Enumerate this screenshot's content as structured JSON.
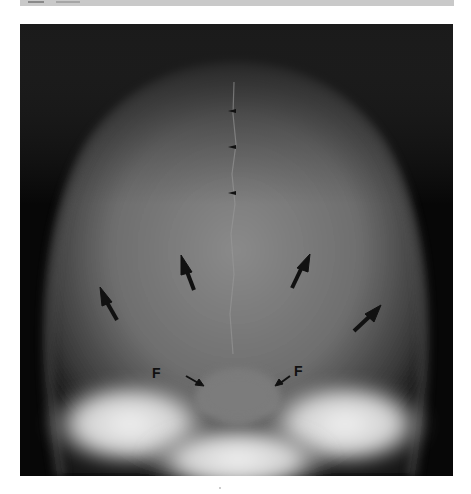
{
  "figure": {
    "header_text": "",
    "background_color": "#050505",
    "annotations": {
      "foramen_labels": [
        {
          "text": "F",
          "side": "left",
          "x": 172,
          "y": 371
        },
        {
          "text": "F",
          "side": "right",
          "x": 293,
          "y": 369
        }
      ],
      "large_arrows_count": 4,
      "small_midline_arrowheads_count": 3
    }
  }
}
